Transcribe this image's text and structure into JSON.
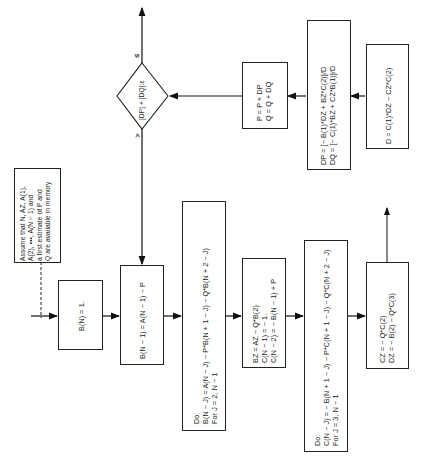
{
  "diagram": {
    "orientation": "rotated-90-ccw",
    "nodes": {
      "assumption": {
        "type": "note",
        "lines": [
          "Assume that N, AZ, A(1),",
          "A(2), •••, A(N − 1) and",
          "a first estimate of P and",
          "Q are available in memory"
        ]
      },
      "init_b": {
        "type": "process",
        "lines": [
          "B(N) = 1."
        ]
      },
      "b_n1": {
        "type": "process",
        "lines": [
          "B(N − 1) = A(N − 1) − P"
        ]
      },
      "loop_b": {
        "type": "process",
        "lines": [
          "Do:",
          "B(N − J) = A(N − J) − P*B(N + 1 − J) − Q*B(N + 2 − J)",
          "For J = 2, N − 1"
        ]
      },
      "bz_c": {
        "type": "process",
        "lines": [
          "BZ = AZ − Q*B(2)",
          "C(N − 1) = − 1.",
          "C(N − 2) = − B(N − 1) + P"
        ]
      },
      "loop_c": {
        "type": "process",
        "lines": [
          "Do:",
          "C(N − J) = − B(N + 1 − J) − P*C(N + 1 − J) − Q*C(N + 2 − J)",
          "For J = 3, N − 1"
        ]
      },
      "cz_dz": {
        "type": "process",
        "lines": [
          "CZ = − Q*C(2)",
          "DZ = − B(2) − Q*C(3)"
        ]
      },
      "d": {
        "type": "process",
        "lines": [
          "D = C(1)*DZ − CZ*C(2)"
        ]
      },
      "dp_dq": {
        "type": "process",
        "lines": [
          "DP = [− B(1)*DZ + BZ*C(2)]/D",
          "DQ = [− C(1)*BZ + CZ*B(1)]/D"
        ]
      },
      "update": {
        "type": "process",
        "lines": [
          "P = P + DP",
          "Q = Q + DQ"
        ]
      },
      "decision": {
        "type": "decision",
        "lines": [
          "|DP| + |DQ|:ε"
        ],
        "branch_up": "≤",
        "branch_down": ">"
      }
    }
  }
}
